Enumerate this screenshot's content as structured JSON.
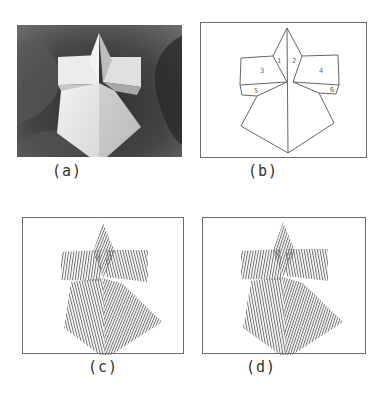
{
  "figure": {
    "panels": [
      {
        "id": "a",
        "caption": "(a)",
        "kind": "photograph",
        "description": "Grayscale photograph of white polyhedral object (cross-shaped block on pyramid) on dark cloth"
      },
      {
        "id": "b",
        "caption": "(b)",
        "kind": "line-drawing",
        "face_labels": [
          "1",
          "2",
          "3",
          "4",
          "5",
          "6"
        ]
      },
      {
        "id": "c",
        "caption": "(c)",
        "kind": "stripe-pattern"
      },
      {
        "id": "d",
        "caption": "(d)",
        "kind": "stripe-pattern"
      }
    ]
  },
  "colors": {
    "line": "#555555",
    "frame": "#6a6a6a",
    "stripe": "#777777",
    "photo_bg": "#3a3a3a",
    "object": "#e6e6e6"
  }
}
